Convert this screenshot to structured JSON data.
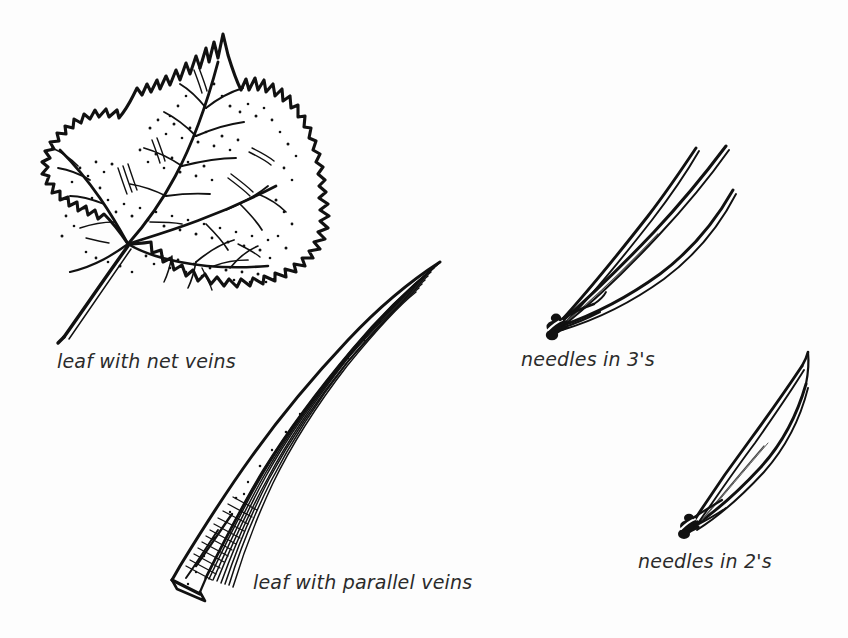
{
  "figure": {
    "background_color": "#fdfdfd",
    "ink_color": "#111111",
    "text_color": "#2b2b2b",
    "width": 848,
    "height": 638
  },
  "labels": {
    "net_veins": "leaf with net veins",
    "parallel_veins": "leaf with parallel veins",
    "needles_three": "needles in 3's",
    "needles_two": "needles in 2's"
  },
  "specimens": [
    {
      "id": "net-veined-leaf",
      "label": "leaf with net veins",
      "drawing": "broad lobed maple-like leaf with toothed margin, palmate netted venation and long petiole",
      "position": "top-left",
      "bounds": {
        "x": 42,
        "y": 30,
        "width": 290,
        "height": 310
      }
    },
    {
      "id": "parallel-veined-leaf",
      "label": "leaf with parallel veins",
      "drawing": "long curving grass blade, wide cut base, tapering to fine tip, many longitudinal parallel veins",
      "position": "bottom-center",
      "bounds": {
        "x": 165,
        "y": 260,
        "width": 280,
        "height": 340
      }
    },
    {
      "id": "needles-in-threes",
      "label": "needles in 3's",
      "drawing": "pine fascicle of three long needles spreading from a dark basal sheath",
      "position": "top-right",
      "needle_count": 3,
      "bounds": {
        "x": 548,
        "y": 108,
        "width": 185,
        "height": 225
      }
    },
    {
      "id": "needles-in-twos",
      "label": "needles in 2's",
      "drawing": "pine fascicle of two needles forming a narrow spindle from a dark basal sheath",
      "position": "right-lower",
      "needle_count": 2,
      "bounds": {
        "x": 683,
        "y": 325,
        "width": 125,
        "height": 205
      }
    }
  ]
}
